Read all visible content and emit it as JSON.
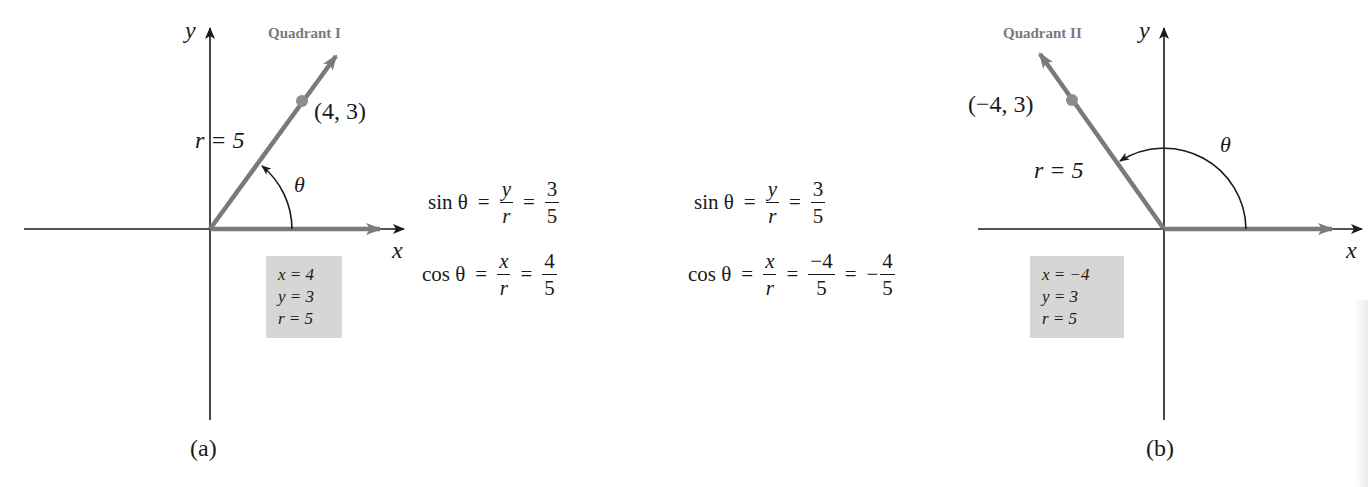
{
  "figure_a": {
    "quadrant_label": "Quadrant I",
    "axis_y": "y",
    "axis_x": "x",
    "point_label": "(4, 3)",
    "radius_label": "r = 5",
    "angle_label": "θ",
    "values_box": [
      "x = 4",
      "y = 3",
      "r = 5"
    ],
    "caption": "(a)",
    "equations": {
      "sin": {
        "lhs": "sin θ",
        "eq": "=",
        "f1_num": "y",
        "f1_den": "r",
        "eq2": "=",
        "f2_num": "3",
        "f2_den": "5"
      },
      "cos": {
        "lhs": "cos θ",
        "eq": "=",
        "f1_num": "x",
        "f1_den": "r",
        "eq2": "=",
        "f2_num": "4",
        "f2_den": "5"
      }
    }
  },
  "figure_b": {
    "quadrant_label": "Quadrant II",
    "axis_y": "y",
    "axis_x": "x",
    "point_label": "(−4, 3)",
    "radius_label": "r = 5",
    "angle_label": "θ",
    "values_box": [
      "x = −4",
      "y = 3",
      "r = 5"
    ],
    "caption": "(b)",
    "equations": {
      "sin": {
        "lhs": "sin θ",
        "eq": "=",
        "f1_num": "y",
        "f1_den": "r",
        "eq2": "=",
        "f2_num": "3",
        "f2_den": "5"
      },
      "cos": {
        "lhs": "cos θ",
        "eq": "=",
        "f1_num": "x",
        "f1_den": "r",
        "eq2": "=",
        "f2_num": "−4",
        "f2_den": "5",
        "eq3": "=",
        "sign": "−",
        "f3_num": "4",
        "f3_den": "5"
      }
    }
  },
  "colors": {
    "terminal_ray": "#7a7a7a",
    "point": "#8c8c8c",
    "axis": "#1a1a1a",
    "box_fill": "#d6d6d6",
    "quadrant_label": "#7a7a7a"
  }
}
